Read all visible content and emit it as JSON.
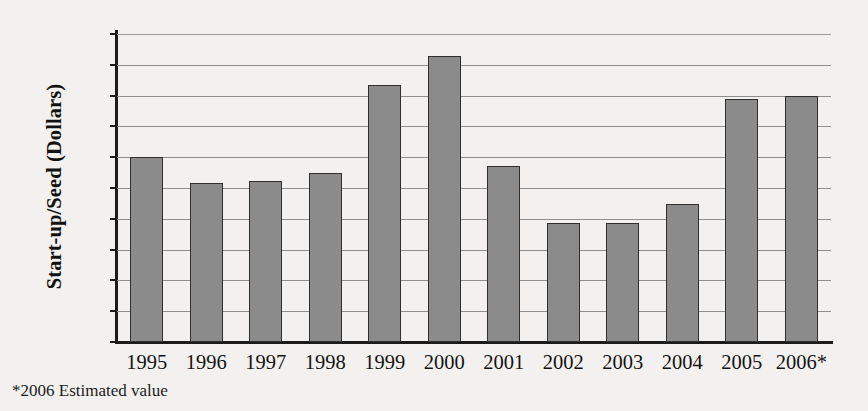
{
  "chart_data": {
    "type": "bar",
    "title": "",
    "xlabel": "",
    "ylabel": "Start-up/Seed (Dollars)",
    "categories": [
      "1995",
      "1996",
      "1997",
      "1998",
      "1999",
      "2000",
      "2001",
      "2002",
      "2003",
      "2004",
      "2005",
      "2006*"
    ],
    "values": [
      3.01,
      2.58,
      2.61,
      2.75,
      4.17,
      4.65,
      2.86,
      1.94,
      1.94,
      2.24,
      3.95,
      3.99
    ],
    "series": [
      {
        "name": "Start-up/Seed (Dollars)",
        "values": [
          3.01,
          2.58,
          2.61,
          2.75,
          4.17,
          4.65,
          2.86,
          1.94,
          1.94,
          2.24,
          3.95,
          3.99
        ]
      }
    ],
    "ylim": [
      0.0,
      5.0
    ],
    "ytick_values": [
      0.0,
      0.5,
      1.0,
      1.5,
      2.0,
      2.5,
      3.0,
      3.5,
      4.0,
      4.5,
      5.0
    ],
    "ytick_labels": [
      "0.0",
      "0.5",
      "1.0",
      "1.5",
      "2.0",
      "2.5",
      "3.0",
      "3.5",
      "4.0",
      "4.5",
      "5.0"
    ],
    "grid": true,
    "grid_axis": "y",
    "legend": false,
    "legend_position": "none",
    "bar_color": "#8b8b8b",
    "bar_edge_color": "#2f2f2f",
    "background_color": "#f2f1ef",
    "annotations": [
      "*2006 Estimated value"
    ]
  },
  "footnote": {
    "text": "*2006 Estimated value"
  }
}
